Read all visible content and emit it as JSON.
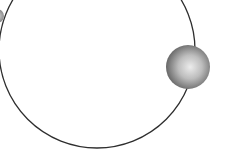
{
  "diagram": {
    "type": "orbit",
    "background": "#ffffff",
    "orbit": {
      "cx": 97,
      "cy": 50,
      "r": 98,
      "stroke": "#2e2e2e",
      "stroke_width": 1.3
    },
    "body": {
      "cx": 188,
      "cy": 67,
      "r": 22,
      "highlight": "#e6e6e6",
      "shadow": "#5a5a5a"
    },
    "edge_object": {
      "cx": -4,
      "cy": 16,
      "r": 7,
      "color": "#8a8a8a"
    }
  }
}
